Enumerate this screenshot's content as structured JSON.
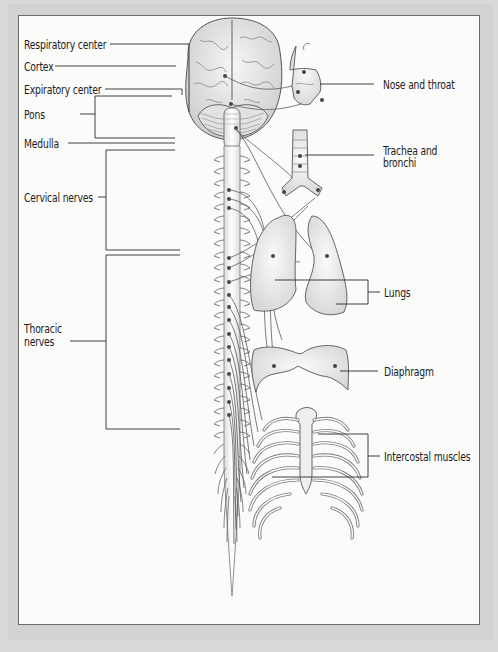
{
  "diagram": {
    "title_visible": false,
    "labels": {
      "respiratory_center": "Respiratory center",
      "cortex": "Cortex",
      "expiratory_center": "Expiratory center",
      "pons": "Pons",
      "medulla": "Medulla",
      "cervical_nerves": "Cervical nerves",
      "thoracic_nerves_line1": "Thoracic",
      "thoracic_nerves_line2": "nerves",
      "nose_and_throat": "Nose and throat",
      "trachea_line1": "Trachea and",
      "trachea_line2": "bronchi",
      "lungs": "Lungs",
      "diaphragm": "Diaphragm",
      "intercostal_muscles": "Intercostal muscles"
    },
    "colors": {
      "frame": "#d2d2d2",
      "panel": "#fbfbfa",
      "ink": "#1c1c1c",
      "line": "#555555",
      "organ_fill": "#f1f1f0"
    }
  }
}
